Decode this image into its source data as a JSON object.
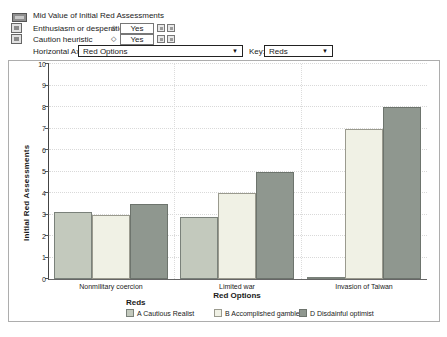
{
  "toolbar": {
    "title": "Mid Value of Initial Red Assessments",
    "inputs": [
      {
        "label": "Enthusiasm or desperation?",
        "value": "Yes"
      },
      {
        "label": "Caution heuristic",
        "value": "Yes"
      }
    ],
    "horizontal_axis": {
      "label": "Horizontal Axis:",
      "value": "Red Options"
    },
    "key": {
      "label": "Key:",
      "value": "Reds"
    }
  },
  "icons": {
    "dropdown_arrow": "▼",
    "input_diamond": "◇"
  },
  "chart_data": {
    "type": "bar",
    "title": "Mid Value of Initial Red Assessments",
    "categories": [
      "Nonmilitary coercion",
      "Limited war",
      "Invasion of Taiwan"
    ],
    "series": [
      {
        "name": "A Cautious Realist",
        "color": "#c3c9bd",
        "border": "#7a817a",
        "values": [
          3.1,
          2.9,
          0.1
        ]
      },
      {
        "name": "B Accomplished gambler",
        "color": "#f0f1e5",
        "border": "#9a9a8e",
        "values": [
          3.0,
          4.0,
          7.0
        ]
      },
      {
        "name": "D Disdainful optimist",
        "color": "#8f978f",
        "border": "#6d746d",
        "values": [
          3.5,
          5.0,
          8.0
        ]
      }
    ],
    "xlabel": "Red Options",
    "ylabel": "Initial Red Assessments",
    "ylim": [
      0,
      10
    ],
    "yticks": [
      0,
      1,
      2,
      3,
      4,
      5,
      6,
      7,
      8,
      9,
      10
    ],
    "grid": true,
    "legend_title": "Reds",
    "legend_position": "bottom"
  }
}
